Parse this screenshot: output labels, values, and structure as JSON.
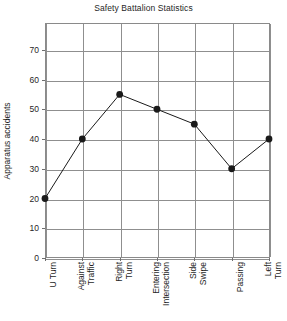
{
  "chart_data": {
    "type": "line",
    "title": "Safety Battalion Statistics",
    "xlabel": "",
    "ylabel": "Apparatus accidents",
    "categories": [
      "U Turn",
      "Against Traffic",
      "Right Turn",
      "Entering Intersection",
      "Side Swipe",
      "Passing",
      "Left Turn"
    ],
    "category_lines": [
      [
        "U Turn"
      ],
      [
        "Against",
        "Traffic"
      ],
      [
        "Right",
        "Turn"
      ],
      [
        "Entering",
        "Intersection"
      ],
      [
        "Side",
        "Swipe"
      ],
      [
        "Passing"
      ],
      [
        "Left",
        "Turn"
      ]
    ],
    "values": [
      20,
      40,
      55,
      50,
      45,
      30,
      40
    ],
    "ylim": [
      0,
      79
    ],
    "yticks": [
      0,
      10,
      20,
      30,
      40,
      50,
      60,
      70
    ],
    "ytick_labels": [
      "0",
      "10",
      "20",
      "30",
      "40",
      "50",
      "60",
      "70"
    ],
    "grid": true,
    "grid_axis": "both",
    "legend": "none",
    "marker": "filled-circle",
    "series_color": "#1a1a1a",
    "grid_color": "#8f8f8f",
    "frame_color": "#8a8a8a",
    "background_color": "#ffffff"
  }
}
